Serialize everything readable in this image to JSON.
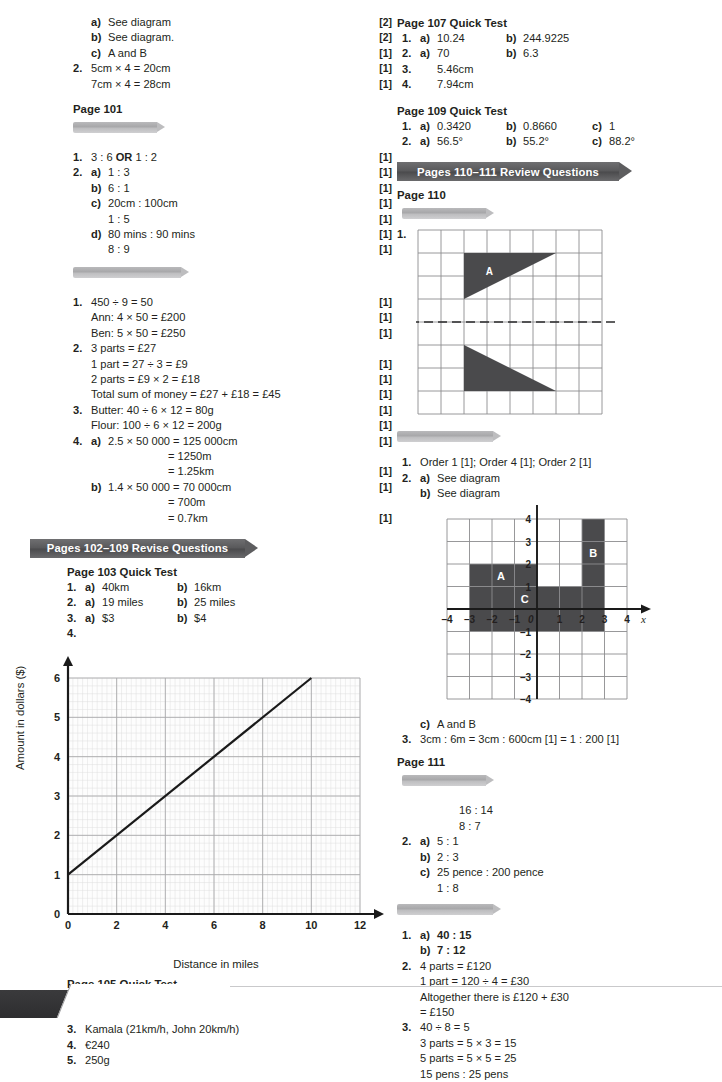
{
  "colors": {
    "shape_fill": "#4a4a4c",
    "banner_dark": "#58585a",
    "tag_grey": "#b5b5b7",
    "text": "#231f20",
    "grid_line": "#8c8c8e"
  },
  "left_column": {
    "top_answers": [
      {
        "num": "",
        "letter": "a)",
        "text": "See diagram",
        "mark": "[2]",
        "indent": 1
      },
      {
        "num": "",
        "letter": "b)",
        "text": "See diagram.",
        "mark": "[2]",
        "indent": 1
      },
      {
        "num": "",
        "letter": "c)",
        "text": "A and B",
        "mark": "[1]",
        "indent": 1
      },
      {
        "num": "2.",
        "letter": "",
        "text": "5cm × 4 = 20cm",
        "mark": "[1]",
        "indent": 0
      },
      {
        "num": "",
        "letter": "",
        "text": "7cm × 4 = 28cm",
        "mark": "[1]",
        "indent": 1
      }
    ],
    "page_101_heading": "Page 101",
    "page_101_group1": [
      {
        "num": "1.",
        "letter": "",
        "text": "3 : 6 OR 1 : 2",
        "mark": "[1]",
        "indent": 0,
        "bold_part": "OR"
      },
      {
        "num": "2.",
        "letter": "a)",
        "text": "1 : 3",
        "mark": "[1]",
        "indent": 0
      },
      {
        "num": "",
        "letter": "b)",
        "text": "6 : 1",
        "mark": "[1]",
        "indent": 1
      },
      {
        "num": "",
        "letter": "c)",
        "text": "20cm : 100cm",
        "mark": "[1]",
        "indent": 1
      },
      {
        "num": "",
        "letter": "",
        "text": "1 : 5",
        "mark": "[1]",
        "indent": 2
      },
      {
        "num": "",
        "letter": "d)",
        "text": "80 mins : 90 mins",
        "mark": "[1]",
        "indent": 1
      },
      {
        "num": "",
        "letter": "",
        "text": "8 : 9",
        "mark": "[1]",
        "indent": 2
      }
    ],
    "page_101_group2": [
      {
        "num": "1.",
        "letter": "",
        "text": "450 ÷ 9 = 50",
        "mark": "[1]",
        "indent": 0
      },
      {
        "num": "",
        "letter": "",
        "text": "Ann: 4 × 50 = £200",
        "mark": "[1]",
        "indent": 1
      },
      {
        "num": "",
        "letter": "",
        "text": "Ben: 5 × 50 = £250",
        "mark": "[1]",
        "indent": 1
      },
      {
        "num": "2.",
        "letter": "",
        "text": "3 parts = £27",
        "mark": "",
        "indent": 0
      },
      {
        "num": "",
        "letter": "",
        "text": "1 part = 27 ÷ 3 = £9",
        "mark": "[1]",
        "indent": 1
      },
      {
        "num": "",
        "letter": "",
        "text": "2 parts = £9 × 2 = £18",
        "mark": "[1]",
        "indent": 1
      },
      {
        "num": "",
        "letter": "",
        "text": "Total sum of money = £27 + £18 = £45",
        "mark": "[1]",
        "indent": 1
      },
      {
        "num": "3.",
        "letter": "",
        "text": "Butter: 40 ÷ 6 × 12 = 80g",
        "mark": "[1]",
        "indent": 0
      },
      {
        "num": "",
        "letter": "",
        "text": "Flour: 100 ÷ 6 × 12 = 200g",
        "mark": "[1]",
        "indent": 1
      },
      {
        "num": "4.",
        "letter": "a)",
        "text": "2.5 × 50 000 = 125 000cm",
        "mark": "[1]",
        "indent": 0
      },
      {
        "num": "",
        "letter": "",
        "text": "= 1250m",
        "mark": "",
        "indent": 4
      },
      {
        "num": "",
        "letter": "",
        "text": "= 1.25km",
        "mark": "[1]",
        "indent": 4
      },
      {
        "num": "",
        "letter": "b)",
        "text": "1.4 × 50 000 = 70 000cm",
        "mark": "[1]",
        "indent": 1
      },
      {
        "num": "",
        "letter": "",
        "text": "= 700m",
        "mark": "",
        "indent": 4
      },
      {
        "num": "",
        "letter": "",
        "text": "= 0.7km",
        "mark": "[1]",
        "indent": 4
      }
    ],
    "revise_banner": "Pages 102–109 Revise Questions",
    "page_103_heading": "Page 103 Quick Test",
    "page_103_rows": [
      {
        "num": "1.",
        "a_letter": "a)",
        "a_text": "40km",
        "b_letter": "b)",
        "b_text": "16km"
      },
      {
        "num": "2.",
        "a_letter": "a)",
        "a_text": "19 miles",
        "b_letter": "b)",
        "b_text": "25 miles"
      },
      {
        "num": "3.",
        "a_letter": "a)",
        "a_text": "$3",
        "b_letter": "b)",
        "b_text": "$4"
      },
      {
        "num": "4.",
        "a_letter": "",
        "a_text": "",
        "b_letter": "",
        "b_text": ""
      }
    ],
    "page_105_heading": "Page 105 Quick Test",
    "page_105_rows": [
      {
        "num": "1.",
        "text": "1.5 hours"
      },
      {
        "num": "2.",
        "text": "80km/h"
      },
      {
        "num": "3.",
        "text": "Kamala (21km/h, John 20km/h)"
      },
      {
        "num": "4.",
        "text": "€240"
      },
      {
        "num": "5.",
        "text": "250g"
      }
    ]
  },
  "chart_data": {
    "type": "line",
    "title": "",
    "xlabel": "Distance in miles",
    "ylabel": "Amount in dollars ($)",
    "xlim": [
      0,
      12
    ],
    "ylim": [
      0,
      6
    ],
    "xticks": [
      0,
      2,
      4,
      6,
      8,
      10,
      12
    ],
    "yticks": [
      0,
      1,
      2,
      3,
      4,
      5,
      6
    ],
    "grid": true,
    "minor_grid": true,
    "legend": "none",
    "series": [
      {
        "name": "conversion line",
        "points": [
          [
            0,
            1
          ],
          [
            10,
            6
          ]
        ]
      }
    ]
  },
  "right_column": {
    "page_107_heading": "Page 107 Quick Test",
    "page_107_rows": [
      {
        "num": "1.",
        "a_letter": "a)",
        "a_text": "10.24",
        "b_letter": "b)",
        "b_text": "244.9225",
        "c_letter": "",
        "c_text": ""
      },
      {
        "num": "2.",
        "a_letter": "a)",
        "a_text": "70",
        "b_letter": "b)",
        "b_text": "6.3",
        "c_letter": "",
        "c_text": ""
      },
      {
        "num": "3.",
        "a_letter": "",
        "a_text": "5.46cm",
        "b_letter": "",
        "b_text": "",
        "c_letter": "",
        "c_text": ""
      },
      {
        "num": "4.",
        "a_letter": "",
        "a_text": "7.94cm",
        "b_letter": "",
        "b_text": "",
        "c_letter": "",
        "c_text": ""
      }
    ],
    "page_109_heading": "Page 109 Quick Test",
    "page_109_rows": [
      {
        "num": "1.",
        "a_letter": "a)",
        "a_text": "0.3420",
        "b_letter": "b)",
        "b_text": "0.8660",
        "c_letter": "c)",
        "c_text": "1"
      },
      {
        "num": "2.",
        "a_letter": "a)",
        "a_text": "56.5°",
        "b_letter": "b)",
        "b_text": "55.2°",
        "c_letter": "c)",
        "c_text": "88.2°"
      }
    ],
    "review_banner": "Pages 110–111 Review Questions",
    "page_110_heading": "Page 110",
    "diagram1_number": "1.",
    "diagram1": {
      "cols": 8,
      "rows": 8,
      "mirror_row": 4,
      "triangle_a_label": "A",
      "triangle_a": "M 2,1 L 6,1 L 2,3 Z",
      "triangle_b": "M 2,5 L 2,7 L 6,7 Z"
    },
    "after_diagram1": [
      {
        "num": "1.",
        "letter": "",
        "text": "Order 1 [1]; Order 4 [1]; Order 2 [1]",
        "indent": 0
      },
      {
        "num": "2.",
        "letter": "a)",
        "text": "See diagram",
        "indent": 0
      },
      {
        "num": "",
        "letter": "b)",
        "text": "See diagram",
        "indent": 1
      }
    ],
    "diagram2": {
      "x_axis_label": "x",
      "y_axis_label": "y",
      "xticks": [
        "-4",
        "-3",
        "-2",
        "-1",
        "0",
        "1",
        "2",
        "3",
        "4"
      ],
      "yticks": [
        "-4",
        "-3",
        "-2",
        "-1",
        "1",
        "2",
        "3",
        "4"
      ],
      "shapes": [
        {
          "label": "A",
          "x0": -3,
          "y0": 1,
          "x1": 0,
          "y1": 2
        },
        {
          "label": "B",
          "x0": 2,
          "y0": 1,
          "x1": 3,
          "y1": 4
        },
        {
          "label": "C",
          "x0": -3,
          "y0": -1,
          "x1": 3,
          "y1": 1
        }
      ]
    },
    "after_diagram2": [
      {
        "num": "",
        "letter": "c)",
        "text": "A and B",
        "indent": 1
      },
      {
        "num": "3.",
        "letter": "",
        "text": "3cm : 6m = 3cm : 600cm [1] = 1 : 200 [1]",
        "indent": 0
      }
    ],
    "page_111_heading": "Page 111",
    "page_111_group1": [
      {
        "num": "1.",
        "letter": "",
        "text": "16 : 14",
        "indent": 3
      },
      {
        "num": "",
        "letter": "",
        "text": "8 : 7",
        "indent": 3,
        "extra": 10
      },
      {
        "num": "2.",
        "letter": "a)",
        "text": "5 : 1",
        "indent": 0
      },
      {
        "num": "",
        "letter": "b)",
        "text": "2 : 3",
        "indent": 1
      },
      {
        "num": "",
        "letter": "c)",
        "text": "25 pence : 200 pence",
        "indent": 1
      },
      {
        "num": "",
        "letter": "",
        "text": "1 : 8",
        "indent": 2
      }
    ],
    "page_111_group2": [
      {
        "num": "1.",
        "letter": "a)",
        "text": "40 : 15",
        "indent": 0,
        "bold": true
      },
      {
        "num": "",
        "letter": "b)",
        "text": "7 : 12",
        "indent": 1,
        "bold": true
      },
      {
        "num": "2.",
        "letter": "",
        "text": "4 parts = £120",
        "indent": 0
      },
      {
        "num": "",
        "letter": "",
        "text": "1 part = 120 ÷ 4 = £30",
        "indent": 1
      },
      {
        "num": "",
        "letter": "",
        "text": "Altogether there is £120 + £30",
        "indent": 1
      },
      {
        "num": "",
        "letter": "",
        "text": "= £150",
        "indent": 1
      },
      {
        "num": "3.",
        "letter": "",
        "text": "40 ÷ 8 = 5",
        "indent": 0
      },
      {
        "num": "",
        "letter": "",
        "text": "3 parts = 5 × 3 = 15",
        "indent": 1
      },
      {
        "num": "",
        "letter": "",
        "text": "5 parts = 5 × 5 = 25",
        "indent": 1
      },
      {
        "num": "",
        "letter": "",
        "text": "15 pens : 25 pens",
        "indent": 1
      }
    ]
  }
}
